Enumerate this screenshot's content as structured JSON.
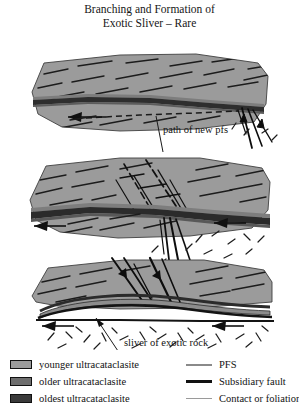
{
  "figure": {
    "title_line1": "Branching and Formation of",
    "title_line2": "Exotic Sliver – Rare",
    "width": 299,
    "height": 420
  },
  "annotations": [
    {
      "id": "path-of-new-pfs",
      "text": "path of new pfs"
    },
    {
      "id": "sliver-of-exotic-rock",
      "text": "sliver of exotic rock"
    }
  ],
  "annotation_pfs": "path of new pfs",
  "annotation_sliver": "sliver of exotic rock",
  "panels": [
    {
      "id": "panel-top",
      "stage": 1,
      "description": "Rock body with through-going fault band and dashed path of incipient new principal fault surface below it; fault strands branch at right margin."
    },
    {
      "id": "panel-middle",
      "stage": 2,
      "description": "Fault band thickened; steeply dipping en-echelon fractures cut foliation above the band; branching strands splay downward below the band."
    },
    {
      "id": "panel-bottom",
      "stage": 3,
      "description": "Lens-shaped sliver of exotic rock isolated between the old and new principal fault surfaces; randomly oriented fabric in footwall below."
    }
  ],
  "legend": {
    "units": [
      {
        "label": "younger ultracataclasite",
        "color": "#9b9b9b",
        "swatch": "younger-ultracataclasite-swatch"
      },
      {
        "label": "older ultracataclasite",
        "color": "#6e6e6e",
        "swatch": "older-ultracataclasite-swatch"
      },
      {
        "label": "oldest ultracataclasite",
        "color": "#3a3a3a",
        "swatch": "oldest-ultracataclasite-swatch"
      }
    ],
    "lines": [
      {
        "label": "PFS",
        "color": "#8a8a8a",
        "thickness": 1.5
      },
      {
        "label": "Subsidiary fault",
        "color": "#111111",
        "thickness": 2.5
      },
      {
        "label": "Contact or foliation",
        "color": "#9a9a9a",
        "thickness": 1
      }
    ]
  },
  "colors": {
    "body_fill": "#9b9b9b",
    "body_fill_light": "#a8a8a8",
    "band_mid": "#6e6e6e",
    "band_dark": "#3a3a3a",
    "stroke": "#111111",
    "background": "#ffffff"
  }
}
